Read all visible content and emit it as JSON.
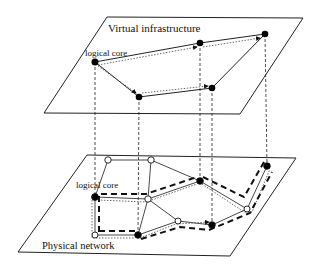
{
  "diagram": {
    "top_plane": {
      "label": "Virtual infrastructure",
      "core_label": "logical core",
      "nodes": [
        "core",
        "v2",
        "v3",
        "v4",
        "v5"
      ]
    },
    "bottom_plane": {
      "label": "Physical network",
      "core_label": "logical core"
    },
    "legend_styles": {
      "solid": "virtual link",
      "dotted": "route direction",
      "dashed": "mapped physical path"
    },
    "colors": {
      "line": "#222222",
      "node_filled": "#000000",
      "node_open": "#ffffff",
      "background": "#ffffff"
    }
  }
}
